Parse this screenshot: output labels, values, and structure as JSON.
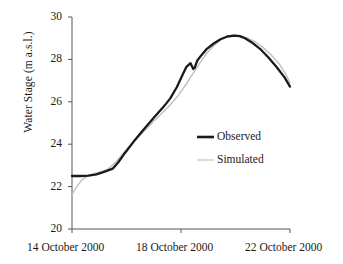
{
  "chart_data": {
    "type": "line",
    "title": "",
    "xlabel": "",
    "ylabel": "Water Stage (m a.s.l.)",
    "ylim": [
      20,
      30
    ],
    "yticks": [
      20,
      22,
      24,
      26,
      28,
      30
    ],
    "ytick_labels": [
      "20",
      "22",
      "24",
      "26",
      "28",
      "30"
    ],
    "xlim": [
      0,
      8
    ],
    "xticks": [
      0,
      4,
      8
    ],
    "xtick_labels": [
      "14 October 2000",
      "18 October 2000",
      "22 October 2000"
    ],
    "grid": false,
    "legend_position": "center-right",
    "series": [
      {
        "name": "Observed",
        "color": "#1a1a1a",
        "width": 2.3,
        "x": [
          0,
          0.3,
          0.6,
          0.9,
          1.15,
          1.35,
          1.5,
          1.7,
          1.95,
          2.25,
          2.6,
          3.0,
          3.35,
          3.6,
          3.85,
          4.05,
          4.2,
          4.35,
          4.45,
          4.5,
          4.6,
          4.75,
          4.95,
          5.2,
          5.45,
          5.7,
          5.95,
          6.15,
          6.35,
          6.6,
          6.9,
          7.2,
          7.5,
          7.8,
          8.0
        ],
        "y": [
          22.5,
          22.5,
          22.52,
          22.58,
          22.68,
          22.78,
          22.85,
          23.15,
          23.6,
          24.1,
          24.65,
          25.25,
          25.75,
          26.15,
          26.7,
          27.25,
          27.65,
          27.82,
          27.55,
          27.6,
          27.95,
          28.2,
          28.5,
          28.75,
          28.95,
          29.08,
          29.12,
          29.1,
          29.0,
          28.8,
          28.5,
          28.1,
          27.65,
          27.15,
          26.72
        ]
      },
      {
        "name": "Simulated",
        "color": "#c2c2c2",
        "width": 1.5,
        "x": [
          0,
          0.15,
          0.35,
          0.6,
          0.85,
          1.1,
          1.35,
          1.6,
          1.9,
          2.2,
          2.55,
          2.9,
          3.25,
          3.6,
          3.9,
          4.2,
          4.45,
          4.7,
          4.95,
          5.2,
          5.45,
          5.7,
          5.95,
          6.2,
          6.45,
          6.7,
          7.0,
          7.3,
          7.6,
          7.85,
          8.0
        ],
        "y": [
          21.62,
          21.95,
          22.3,
          22.52,
          22.62,
          22.72,
          22.85,
          23.15,
          23.6,
          24.05,
          24.5,
          24.95,
          25.4,
          25.85,
          26.3,
          26.85,
          27.35,
          27.85,
          28.3,
          28.65,
          28.92,
          29.08,
          29.15,
          29.12,
          29.0,
          28.85,
          28.58,
          28.22,
          27.8,
          27.3,
          26.9
        ]
      }
    ],
    "legend": [
      {
        "label": "Observed",
        "color": "#1a1a1a",
        "width": 2.6
      },
      {
        "label": "Simulated",
        "color": "#c8c8c8",
        "width": 1.3
      }
    ],
    "axis_color": "#555555"
  }
}
